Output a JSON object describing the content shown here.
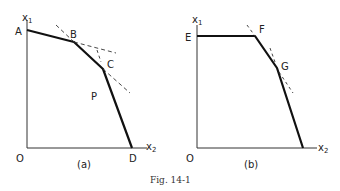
{
  "figure": {
    "caption": "Fig. 14-1",
    "panels": [
      {
        "id": "a",
        "label": "(a)",
        "axis_labels": {
          "y": "x",
          "y_sub": "1",
          "x": "x",
          "x_sub": "2",
          "origin": "O"
        },
        "vertices": [
          {
            "name": "A"
          },
          {
            "name": "B"
          },
          {
            "name": "C"
          },
          {
            "name": "D"
          }
        ],
        "region_label": "P"
      },
      {
        "id": "b",
        "label": "(b)",
        "axis_labels": {
          "y": "x",
          "y_sub": "1",
          "x": "x",
          "x_sub": "2",
          "origin": "O"
        },
        "vertices": [
          {
            "name": "E"
          },
          {
            "name": "F"
          },
          {
            "name": "G"
          }
        ]
      }
    ]
  }
}
